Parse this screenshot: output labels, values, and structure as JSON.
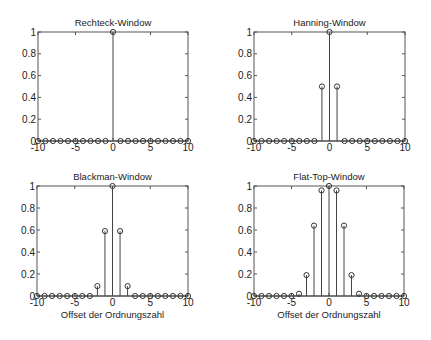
{
  "chart_data": [
    {
      "type": "stem",
      "title": "Rechteck-Window",
      "xlabel": "",
      "ylabel": "",
      "xlim": [
        -10,
        10
      ],
      "ylim": [
        0,
        1
      ],
      "xticks": [
        -10,
        -5,
        0,
        5,
        10
      ],
      "yticks": [
        0,
        0.2,
        0.4,
        0.6,
        0.8,
        1
      ],
      "xtick_labels": [
        "-10",
        "-5",
        "0",
        "5",
        "10"
      ],
      "ytick_labels": [
        "0",
        "0.2",
        "0.4",
        "0.6",
        "0.8",
        "1"
      ],
      "x": [
        -10,
        -9,
        -8,
        -7,
        -6,
        -5,
        -4,
        -3,
        -2,
        -1,
        0,
        1,
        2,
        3,
        4,
        5,
        6,
        7,
        8,
        9,
        10
      ],
      "values": [
        0,
        0,
        0,
        0,
        0,
        0,
        0,
        0,
        0,
        0,
        1,
        0,
        0,
        0,
        0,
        0,
        0,
        0,
        0,
        0,
        0
      ],
      "grid": false
    },
    {
      "type": "stem",
      "title": "Hanning-Window",
      "xlabel": "",
      "ylabel": "",
      "xlim": [
        -10,
        10
      ],
      "ylim": [
        0,
        1
      ],
      "xticks": [
        -10,
        -5,
        0,
        5,
        10
      ],
      "yticks": [
        0,
        0.2,
        0.4,
        0.6,
        0.8,
        1
      ],
      "xtick_labels": [
        "-10",
        "-5",
        "0",
        "5",
        "10"
      ],
      "ytick_labels": [
        "0",
        "0.2",
        "0.4",
        "0.6",
        "0.8",
        "1"
      ],
      "x": [
        -10,
        -9,
        -8,
        -7,
        -6,
        -5,
        -4,
        -3,
        -2,
        -1,
        0,
        1,
        2,
        3,
        4,
        5,
        6,
        7,
        8,
        9,
        10
      ],
      "values": [
        0,
        0,
        0,
        0,
        0,
        0,
        0,
        0,
        0,
        0.5,
        1,
        0.5,
        0,
        0,
        0,
        0,
        0,
        0,
        0,
        0,
        0
      ],
      "grid": false
    },
    {
      "type": "stem",
      "title": "Blackman-Window",
      "xlabel": "Offset der Ordnungszahl",
      "ylabel": "",
      "xlim": [
        -10,
        10
      ],
      "ylim": [
        0,
        1
      ],
      "xticks": [
        -10,
        -5,
        0,
        5,
        10
      ],
      "yticks": [
        0,
        0.2,
        0.4,
        0.6,
        0.8,
        1
      ],
      "xtick_labels": [
        "-10",
        "-5",
        "0",
        "5",
        "10"
      ],
      "ytick_labels": [
        "0",
        "0.2",
        "0.4",
        "0.6",
        "0.8",
        "1"
      ],
      "x": [
        -10,
        -9,
        -8,
        -7,
        -6,
        -5,
        -4,
        -3,
        -2,
        -1,
        0,
        1,
        2,
        3,
        4,
        5,
        6,
        7,
        8,
        9,
        10
      ],
      "values": [
        0,
        0,
        0,
        0,
        0,
        0,
        0,
        0,
        0.09,
        0.59,
        1,
        0.59,
        0.09,
        0,
        0,
        0,
        0,
        0,
        0,
        0,
        0
      ],
      "grid": false
    },
    {
      "type": "stem",
      "title": "Flat-Top-Window",
      "xlabel": "Offset der Ordnungszahl",
      "ylabel": "",
      "xlim": [
        -10,
        10
      ],
      "ylim": [
        0,
        1
      ],
      "xticks": [
        -10,
        -5,
        0,
        5,
        10
      ],
      "yticks": [
        0,
        0.2,
        0.4,
        0.6,
        0.8,
        1
      ],
      "xtick_labels": [
        "-10",
        "-5",
        "0",
        "5",
        "10"
      ],
      "ytick_labels": [
        "0",
        "0.2",
        "0.4",
        "0.6",
        "0.8",
        "1"
      ],
      "x": [
        -10,
        -9,
        -8,
        -7,
        -6,
        -5,
        -4,
        -3,
        -2,
        -1,
        0,
        1,
        2,
        3,
        4,
        5,
        6,
        7,
        8,
        9,
        10
      ],
      "values": [
        0,
        0,
        0,
        0,
        0,
        0,
        0.02,
        0.19,
        0.64,
        0.96,
        1,
        0.96,
        0.64,
        0.19,
        0.02,
        0,
        0,
        0,
        0,
        0,
        0
      ],
      "grid": false
    }
  ]
}
